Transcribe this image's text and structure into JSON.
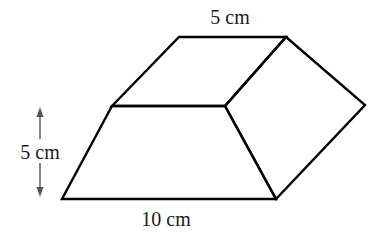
{
  "figure": {
    "type": "trapezoidal prism",
    "labels": {
      "top_edge": "5 cm",
      "height": "5 cm",
      "bottom_edge": "10 cm"
    },
    "stroke_color": "#000000",
    "arrow_color": "#555555",
    "vertices": {
      "top_back_left": [
        179,
        37
      ],
      "top_back_right": [
        286,
        37
      ],
      "top_front_left": [
        112,
        106
      ],
      "top_front_right": [
        225,
        106
      ],
      "bottom_front_left": [
        62,
        199
      ],
      "bottom_front_right": [
        276,
        199
      ],
      "back_right": [
        365,
        105
      ]
    }
  }
}
